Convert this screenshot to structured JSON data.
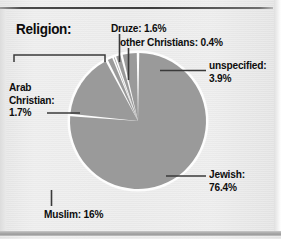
{
  "figure": {
    "title": "Religion:",
    "background_color": "#eaeaea",
    "slice_color": "#9a9a9a",
    "text_color": "#0d0d0d",
    "separator_color": "#ffffff",
    "leader_line_color": "#3a3a3a"
  },
  "labels": {
    "druze": "Druze: 1.6%",
    "other_christians": "other Christians: 0.4%",
    "unspecified_line1": "unspecified:",
    "unspecified_line2": "3.9%",
    "jewish_line1": "Jewish:",
    "jewish_line2": "76.4%",
    "muslim": "Muslim: 16%",
    "arab_christian_line1": "Arab",
    "arab_christian_line2": "Christian:",
    "arab_christian_line3": "1.7%"
  },
  "chart_data": {
    "type": "pie",
    "title": "Religion:",
    "xlabel": "",
    "ylabel": "",
    "units": "percent",
    "start_angle_deg": 0,
    "direction": "clockwise",
    "legend_position": "callout-labels",
    "grid": false,
    "categories": [
      "Jewish",
      "Muslim",
      "Arab Christian",
      "other Christians",
      "Druze",
      "unspecified"
    ],
    "values": [
      76.4,
      16,
      1.7,
      0.4,
      1.6,
      3.9
    ],
    "labels": [
      "Jewish: 76.4%",
      "Muslim: 16%",
      "Arab Christian: 1.7%",
      "other Christians: 0.4%",
      "Druze: 1.6%",
      "unspecified: 3.9%"
    ],
    "colors": [
      "#9a9a9a",
      "#9a9a9a",
      "#9a9a9a",
      "#9a9a9a",
      "#9a9a9a",
      "#9a9a9a"
    ],
    "slices": [
      {
        "name": "Jewish",
        "value": 76.4,
        "label": "Jewish: 76.4%"
      },
      {
        "name": "Muslim",
        "value": 16,
        "label": "Muslim: 16%"
      },
      {
        "name": "Arab Christian",
        "value": 1.7,
        "label": "Arab Christian: 1.7%"
      },
      {
        "name": "other Christians",
        "value": 0.4,
        "label": "other Christians: 0.4%"
      },
      {
        "name": "Druze",
        "value": 1.6,
        "label": "Druze: 1.6%"
      },
      {
        "name": "unspecified",
        "value": 3.9,
        "label": "unspecified: 3.9%"
      }
    ]
  }
}
